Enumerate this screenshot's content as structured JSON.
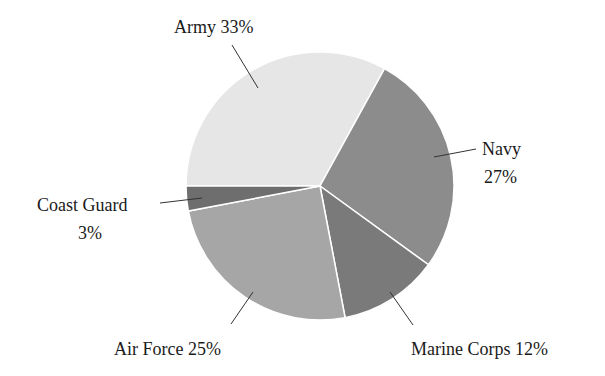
{
  "chart_data": {
    "type": "pie",
    "title": "",
    "categories": [
      "Army",
      "Navy",
      "Marine Corps",
      "Air Force",
      "Coast Guard"
    ],
    "values": [
      33,
      27,
      12,
      25,
      3
    ],
    "unit": "%",
    "colors": [
      "#e6e6e6",
      "#8c8c8c",
      "#7a7a7a",
      "#a6a6a6",
      "#6e6e6e"
    ],
    "legend": "none (direct labels with leader lines)",
    "labels": [
      {
        "category": "Army",
        "lines": [
          "Army 33%"
        ]
      },
      {
        "category": "Navy",
        "lines": [
          "Navy",
          "27%"
        ]
      },
      {
        "category": "Marine Corps",
        "lines": [
          "Marine Corps 12%"
        ]
      },
      {
        "category": "Air Force",
        "lines": [
          "Air Force 25%"
        ]
      },
      {
        "category": "Coast Guard",
        "lines": [
          "Coast Guard",
          "3%"
        ]
      }
    ]
  }
}
